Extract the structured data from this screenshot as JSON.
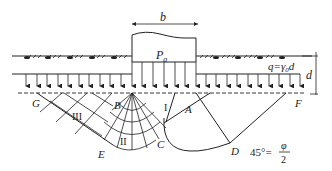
{
  "figure": {
    "type": "diagram",
    "labels": {
      "width": "b",
      "footing_pressure": "P",
      "footing_pressure_sub": "a",
      "surcharge": "q=γ",
      "surcharge_sub": "0",
      "surcharge_tail": "d",
      "depth": "d",
      "zone_1": "I",
      "zone_2": "II",
      "zone_3": "III",
      "point_A": "A",
      "point_B": "B",
      "point_C": "C",
      "point_D": "D",
      "point_E": "E",
      "point_F": "F",
      "point_G": "G",
      "angle_lhs": "45°=",
      "angle_num": "φ",
      "angle_den": "2"
    },
    "colors": {
      "line": "#222222",
      "background": "#ffffff"
    }
  }
}
